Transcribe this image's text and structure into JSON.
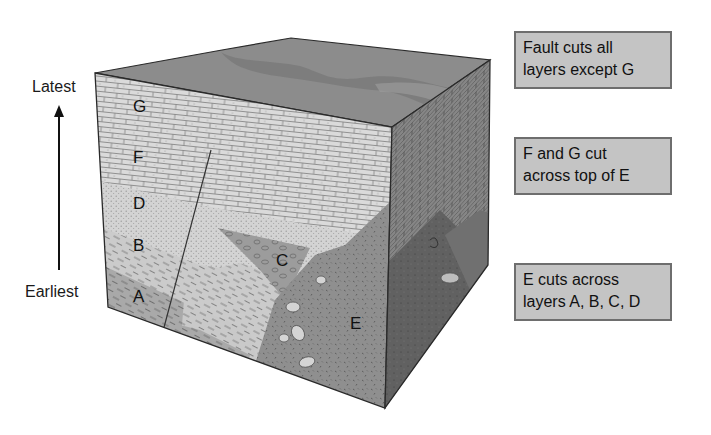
{
  "time_axis": {
    "top_label": "Latest",
    "bottom_label": "Earliest",
    "arrow_direction": "up"
  },
  "layers": [
    {
      "id": "G",
      "label": "G",
      "rock": "limestone (brick pattern)",
      "color": "#d8d8d8"
    },
    {
      "id": "F",
      "label": "F",
      "rock": "limestone (brick pattern)",
      "color": "#d2d2d2"
    },
    {
      "id": "D",
      "label": "D",
      "rock": "sandstone (dotted)",
      "color": "#cfcfcf"
    },
    {
      "id": "B",
      "label": "B",
      "rock": "shale (dashed)",
      "color": "#c6c6c6"
    },
    {
      "id": "A",
      "label": "A",
      "rock": "shale (dashed, darker)",
      "color": "#a8a8a8"
    },
    {
      "id": "C",
      "label": "C",
      "rock": "conglomerate",
      "color": "#9a9a9a"
    },
    {
      "id": "E",
      "label": "E",
      "rock": "igneous intrusion",
      "color": "#8f8f8f"
    }
  ],
  "notes": [
    {
      "line1": "Fault cuts all",
      "line2": "layers except G"
    },
    {
      "line1": "F and G cut",
      "line2": "across top of E"
    },
    {
      "line1": "E cuts across",
      "line2": "layers A, B, C, D"
    }
  ],
  "colors": {
    "top_surface": "#8c8c8c",
    "top_channel": "#7a7a7a",
    "right_face_upper": "#7c7c7c",
    "right_face_lower": "#5e5e5e",
    "note_fill": "#c4c4c4",
    "note_border": "#6e6e6e",
    "outline": "#2a2a2a"
  }
}
